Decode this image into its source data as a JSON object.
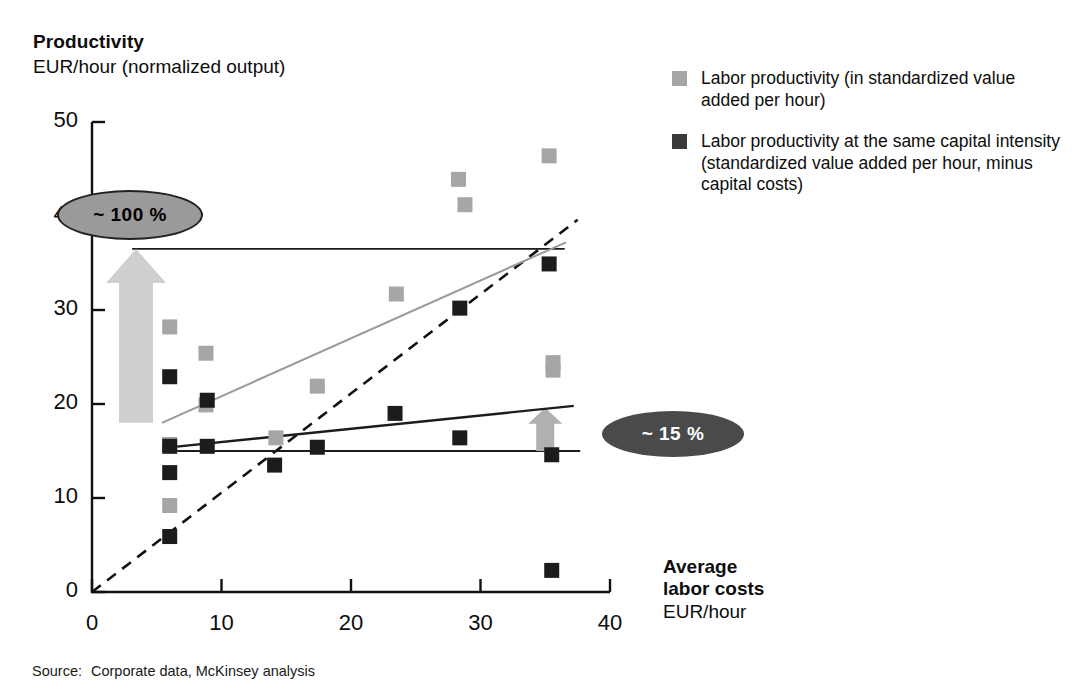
{
  "header": {
    "title": "Productivity",
    "subtitle": "EUR/hour (normalized output)"
  },
  "legend": {
    "items": [
      {
        "label": "Labor productivity (in standardized value added per hour)",
        "color": "#a6a6a6",
        "swatch_name": "legend-swatch-light"
      },
      {
        "label": "Labor productivity at the same capital intensity (standardized value added per hour, minus capital costs)",
        "color": "#3a3a3a",
        "swatch_name": "legend-swatch-dark"
      }
    ]
  },
  "axes": {
    "x_caption_bold": "Average\nlabor costs",
    "x_caption_bold_line1": "Average",
    "x_caption_bold_line2": "labor costs",
    "x_caption_unit": "EUR/hour",
    "y_ticks": [
      "0",
      "10",
      "20",
      "30",
      "40",
      "50"
    ],
    "x_ticks": [
      "0",
      "10",
      "20",
      "30",
      "40"
    ]
  },
  "callouts": [
    {
      "name": "callout-100-percent",
      "text": "~ 100 %",
      "fill": "#9a9a9a",
      "text_color": "#000000"
    },
    {
      "name": "callout-15-percent",
      "text": "~ 15 %",
      "fill": "#4a4a4a",
      "text_color": "#ffffff"
    }
  ],
  "footer": {
    "source_label": "Source:",
    "source_text": "Corporate data, McKinsey analysis"
  },
  "chart_data": {
    "type": "scatter",
    "title": "Productivity",
    "subtitle": "EUR/hour (normalized output)",
    "xlabel": "Average labor costs EUR/hour",
    "ylabel": "Productivity EUR/hour (normalized output)",
    "xlim": [
      0,
      40
    ],
    "ylim": [
      0,
      50
    ],
    "grid": false,
    "legend_position": "right",
    "series": [
      {
        "name": "Labor productivity (in standardized value added per hour)",
        "color": "#a6a6a6",
        "marker": "square",
        "points": [
          [
            6.0,
            28.2
          ],
          [
            6.0,
            15.7
          ],
          [
            6.0,
            9.2
          ],
          [
            8.8,
            25.4
          ],
          [
            8.8,
            19.9
          ],
          [
            14.2,
            16.4
          ],
          [
            17.4,
            21.9
          ],
          [
            23.5,
            31.7
          ],
          [
            28.3,
            43.9
          ],
          [
            28.8,
            41.2
          ],
          [
            35.3,
            46.4
          ],
          [
            35.6,
            24.4
          ],
          [
            35.6,
            23.6
          ]
        ]
      },
      {
        "name": "Labor productivity at the same capital intensity (standardized value added per hour, minus capital costs)",
        "color": "#1c1c1c",
        "marker": "square",
        "points": [
          [
            6.0,
            22.9
          ],
          [
            6.0,
            15.5
          ],
          [
            6.0,
            12.7
          ],
          [
            6.0,
            5.9
          ],
          [
            8.9,
            20.4
          ],
          [
            8.9,
            15.5
          ],
          [
            14.1,
            13.5
          ],
          [
            17.4,
            15.4
          ],
          [
            23.4,
            19.0
          ],
          [
            28.4,
            30.2
          ],
          [
            28.4,
            16.4
          ],
          [
            35.3,
            34.9
          ],
          [
            35.5,
            14.6
          ],
          [
            35.5,
            2.3
          ]
        ]
      }
    ],
    "trendlines": [
      {
        "name": "light-trendline",
        "color": "#9a9a9a",
        "x": [
          5.4,
          36.6
        ],
        "y": [
          18.0,
          37.2
        ]
      },
      {
        "name": "dark-trendline",
        "color": "#1c1c1c",
        "x": [
          5.4,
          37.2
        ],
        "y": [
          15.3,
          19.8
        ]
      }
    ],
    "reference_lines": [
      {
        "name": "upper-reference-line",
        "y": 36.5,
        "x": [
          3.1,
          36.5
        ]
      },
      {
        "name": "lower-reference-line",
        "y": 15.0,
        "x": [
          5.4,
          37.7
        ]
      }
    ],
    "diagonal": {
      "name": "parity-dashed-line",
      "style": "dashed",
      "x": [
        0.0,
        37.5
      ],
      "y": [
        0.0,
        39.6
      ]
    },
    "arrows": [
      {
        "name": "arrow-100-percent",
        "x": 3.4,
        "y_from": 18.0,
        "y_to": 36.5,
        "color": "#cfcfcf",
        "label": "~ 100 %"
      },
      {
        "name": "arrow-15-percent",
        "x": 35.0,
        "y_from": 15.0,
        "y_to": 19.6,
        "color": "#b0b0b0",
        "label": "~ 15 %"
      }
    ],
    "annotations": [
      "~ 100 %",
      "~ 15 %"
    ]
  }
}
